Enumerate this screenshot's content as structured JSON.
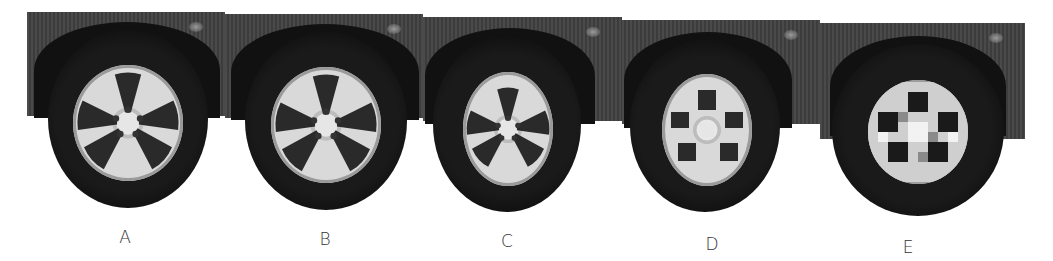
{
  "figure": {
    "panels": [
      {
        "label": "A",
        "resolution": "highest"
      },
      {
        "label": "B",
        "resolution": "high"
      },
      {
        "label": "C",
        "resolution": "medium"
      },
      {
        "label": "D",
        "resolution": "low"
      },
      {
        "label": "E",
        "resolution": "lowest"
      }
    ]
  },
  "colors": {
    "background": "#ffffff",
    "car_body": "#444444",
    "tire": "#0a0a0a",
    "rim": "#d9d9d9",
    "label_text": "#333333"
  }
}
